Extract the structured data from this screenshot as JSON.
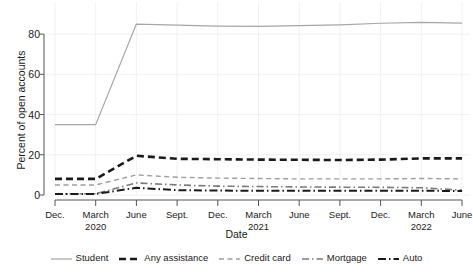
{
  "chart_data": {
    "type": "line",
    "title": "",
    "xlabel": "Date",
    "ylabel": "Percent of open accounts",
    "ylim": [
      0,
      90
    ],
    "yticks": [
      0,
      20,
      40,
      60,
      80
    ],
    "grid": true,
    "legend_position": "bottom",
    "x_tick_labels": [
      {
        "line1": "Dec.",
        "line2": ""
      },
      {
        "line1": "March",
        "line2": "2020"
      },
      {
        "line1": "June",
        "line2": ""
      },
      {
        "line1": "Sept.",
        "line2": ""
      },
      {
        "line1": "Dec.",
        "line2": ""
      },
      {
        "line1": "March",
        "line2": "2021"
      },
      {
        "line1": "June",
        "line2": ""
      },
      {
        "line1": "Sept.",
        "line2": ""
      },
      {
        "line1": "Dec.",
        "line2": ""
      },
      {
        "line1": "March",
        "line2": "2022"
      },
      {
        "line1": "June",
        "line2": ""
      }
    ],
    "x": [
      0,
      1,
      2,
      3,
      4,
      5,
      6,
      7,
      8,
      9,
      10
    ],
    "series": [
      {
        "name": "Student",
        "color": "#a6a6a6",
        "style": "solid",
        "width": 1.2,
        "values": [
          35.0,
          35.0,
          85.0,
          84.5,
          84.0,
          83.8,
          84.2,
          84.6,
          85.4,
          85.8,
          85.5
        ]
      },
      {
        "name": "Any assistance",
        "color": "#1a1a1a",
        "style": "dashed",
        "width": 2.6,
        "values": [
          8.0,
          8.0,
          19.5,
          18.0,
          17.8,
          17.6,
          17.5,
          17.4,
          17.6,
          18.2,
          18.2
        ]
      },
      {
        "name": "Credit card",
        "color": "#9e9e9e",
        "style": "dashed",
        "width": 1.4,
        "values": [
          5.0,
          5.0,
          10.0,
          8.8,
          8.4,
          8.2,
          8.0,
          8.0,
          8.0,
          8.2,
          8.0
        ]
      },
      {
        "name": "Mortgage",
        "color": "#7a7a7a",
        "style": "dashdot",
        "width": 1.6,
        "values": [
          0.6,
          0.6,
          6.0,
          5.0,
          4.4,
          4.2,
          4.0,
          3.9,
          3.8,
          3.6,
          2.4
        ]
      },
      {
        "name": "Auto",
        "color": "#1a1a1a",
        "style": "dashdot",
        "width": 2.0,
        "values": [
          0.5,
          0.5,
          3.6,
          2.4,
          2.2,
          2.1,
          2.1,
          2.1,
          2.1,
          2.1,
          2.0
        ]
      }
    ]
  }
}
